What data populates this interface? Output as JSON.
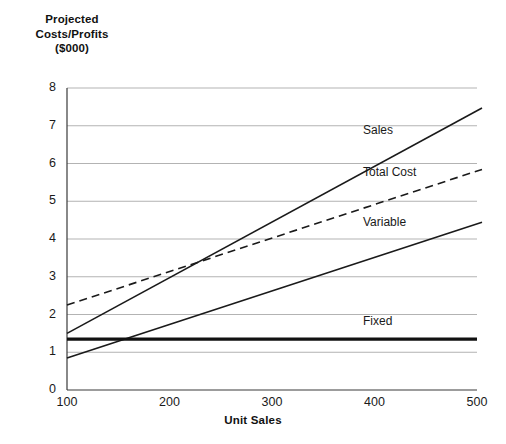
{
  "chart_data": {
    "type": "line",
    "title": "",
    "ylabel_lines": [
      "Projected",
      "Costs/Profits",
      "($000)"
    ],
    "xlabel": "Unit Sales",
    "xlim": [
      100,
      500
    ],
    "ylim": [
      0,
      8
    ],
    "xticks": [
      100,
      200,
      300,
      400,
      500
    ],
    "yticks": [
      0,
      1,
      2,
      3,
      4,
      5,
      6,
      7,
      8
    ],
    "grid": "horizontal",
    "legend_position": "inline-annotations",
    "x": [
      100,
      500
    ],
    "series": [
      {
        "name": "Sales",
        "values": [
          1.5,
          7.4
        ],
        "style": "solid",
        "width": 1.6,
        "color": "#1a1a1a",
        "label_x": 363,
        "label_y": 124
      },
      {
        "name": "Total Cost",
        "values": [
          2.25,
          5.8
        ],
        "style": "dashed",
        "width": 1.6,
        "color": "#1a1a1a",
        "label_x": 363,
        "label_y": 166
      },
      {
        "name": "Variable",
        "values": [
          0.85,
          4.4
        ],
        "style": "solid",
        "width": 1.6,
        "color": "#1a1a1a",
        "label_x": 363,
        "label_y": 216
      },
      {
        "name": "Fixed",
        "values": [
          1.35,
          1.35
        ],
        "style": "solid",
        "width": 3.2,
        "color": "#111111",
        "label_x": 363,
        "label_y": 315
      }
    ],
    "annotations": [
      {
        "text": "breakeven at approx. 230 units, 3.4 ($000)"
      }
    ],
    "colors": {
      "axis": "#3a3a3a",
      "grid": "#b3b3b3",
      "line": "#1a1a1a",
      "text": "#1a1a1a",
      "background": "#ffffff"
    }
  }
}
